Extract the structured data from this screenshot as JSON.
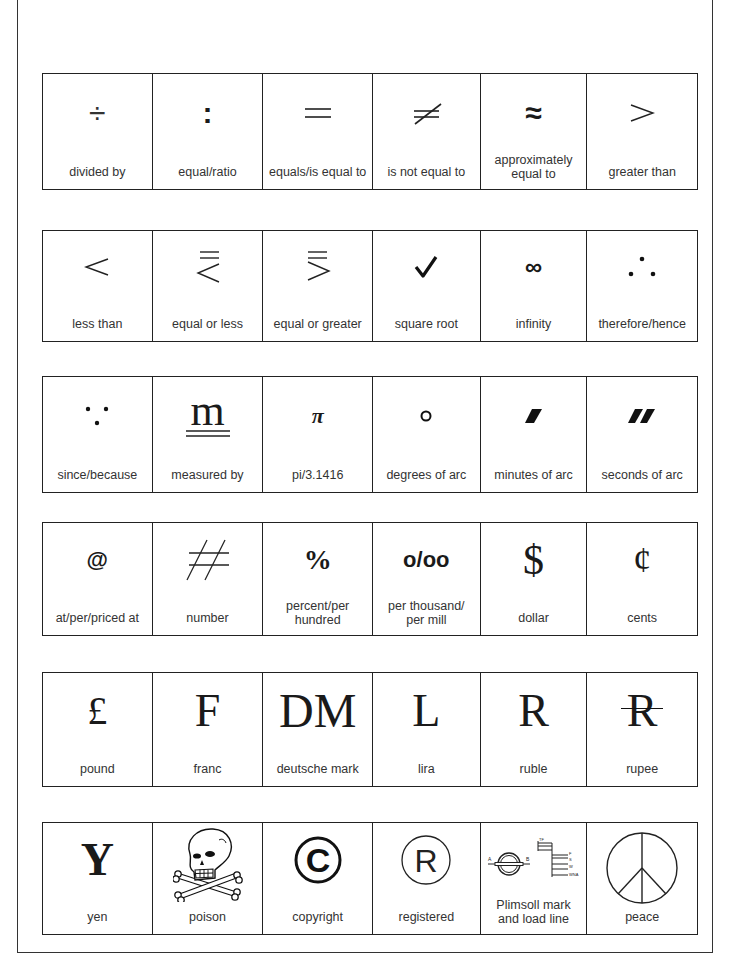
{
  "rows": [
    [
      {
        "symbol": "÷",
        "label": "divided by"
      },
      {
        "symbol": ":",
        "label": "equal/ratio"
      },
      {
        "symbol": "=",
        "label": "equals/is equal to"
      },
      {
        "symbol": "≠",
        "label": "is not equal to"
      },
      {
        "symbol": "≈",
        "label": "approximately equal to",
        "label_lines": [
          "approximately",
          "equal to"
        ]
      },
      {
        "symbol": ">",
        "label": "greater than"
      }
    ],
    [
      {
        "symbol": "<",
        "label": "less than"
      },
      {
        "symbol": "≦",
        "label": "equal or less"
      },
      {
        "symbol": "≧",
        "label": "equal or greater"
      },
      {
        "symbol": "✓",
        "label": "square root"
      },
      {
        "symbol": "∞",
        "label": "infinity"
      },
      {
        "symbol": "∴",
        "label": "therefore/hence"
      }
    ],
    [
      {
        "symbol": "∵",
        "label": "since/because"
      },
      {
        "symbol": "m",
        "label": "measured by"
      },
      {
        "symbol": "π",
        "label": "pi/3.1416"
      },
      {
        "symbol": "°",
        "label": "degrees of arc"
      },
      {
        "symbol": "′",
        "label": "minutes of arc"
      },
      {
        "symbol": "″",
        "label": "seconds of arc"
      }
    ],
    [
      {
        "symbol": "@",
        "label": "at/per/priced at"
      },
      {
        "symbol": "#",
        "label": "number"
      },
      {
        "symbol": "%",
        "label": "percent/per hundred",
        "label_lines": [
          "percent/per",
          "hundred"
        ]
      },
      {
        "symbol": "o/oo",
        "label": "per thousand/per mill",
        "label_lines": [
          "per thousand/",
          "per mill"
        ]
      },
      {
        "symbol": "$",
        "label": "dollar"
      },
      {
        "symbol": "¢",
        "label": "cents"
      }
    ],
    [
      {
        "symbol": "£",
        "label": "pound"
      },
      {
        "symbol": "F",
        "label": "franc"
      },
      {
        "symbol": "DM",
        "label": "deutsche mark"
      },
      {
        "symbol": "L",
        "label": "lira"
      },
      {
        "symbol": "R",
        "label": "ruble"
      },
      {
        "symbol": "R",
        "label": "rupee"
      }
    ],
    [
      {
        "symbol": "Y",
        "label": "yen"
      },
      {
        "symbol": "skull-and-crossbones",
        "label": "poison"
      },
      {
        "symbol": "©",
        "label": "copyright"
      },
      {
        "symbol": "R",
        "label": "registered"
      },
      {
        "symbol": "plimsoll",
        "label": "Plimsoll mark and load line",
        "label_lines": [
          "Plimsoll mark",
          "and load line"
        ],
        "plimsoll_marks": {
          "left": "A",
          "right": "B",
          "top": "TF",
          "lines": [
            "F",
            "S",
            "W",
            "WNA"
          ]
        }
      },
      {
        "symbol": "peace",
        "label": "peace"
      }
    ]
  ]
}
